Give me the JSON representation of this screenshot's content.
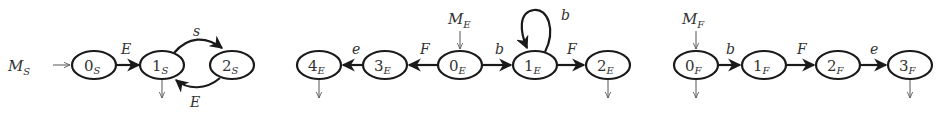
{
  "diagram": {
    "machines": [
      {
        "id": "S",
        "start_label": "M",
        "start_sub": "S",
        "nodes": [
          {
            "id": "0S",
            "num": "0",
            "sub": "S",
            "x": 94,
            "final": false
          },
          {
            "id": "1S",
            "num": "1",
            "sub": "S",
            "x": 162,
            "final": true
          },
          {
            "id": "2S",
            "num": "2",
            "sub": "S",
            "x": 232,
            "final": false
          }
        ],
        "edges": [
          {
            "from": "0S",
            "to": "1S",
            "label": "E"
          },
          {
            "from": "1S",
            "to": "2S",
            "label": "s"
          },
          {
            "from": "2S",
            "to": "1S",
            "label": "E"
          }
        ]
      },
      {
        "id": "E",
        "start_label": "M",
        "start_sub": "E",
        "nodes": [
          {
            "id": "4E",
            "num": "4",
            "sub": "E",
            "x": 319,
            "final": true
          },
          {
            "id": "3E",
            "num": "3",
            "sub": "E",
            "x": 385,
            "final": false
          },
          {
            "id": "0E",
            "num": "0",
            "sub": "E",
            "x": 460,
            "final": false
          },
          {
            "id": "1E",
            "num": "1",
            "sub": "E",
            "x": 535,
            "final": false
          },
          {
            "id": "2E",
            "num": "2",
            "sub": "E",
            "x": 608,
            "final": true
          }
        ],
        "edges": [
          {
            "from": "0E",
            "to": "3E",
            "label": "F"
          },
          {
            "from": "3E",
            "to": "4E",
            "label": "e"
          },
          {
            "from": "0E",
            "to": "1E",
            "label": "b"
          },
          {
            "from": "1E",
            "to": "1E",
            "label": "b"
          },
          {
            "from": "1E",
            "to": "2E",
            "label": "F"
          }
        ]
      },
      {
        "id": "F",
        "start_label": "M",
        "start_sub": "F",
        "nodes": [
          {
            "id": "0F",
            "num": "0",
            "sub": "F",
            "x": 696,
            "final": true
          },
          {
            "id": "1F",
            "num": "1",
            "sub": "F",
            "x": 764,
            "final": false
          },
          {
            "id": "2F",
            "num": "2",
            "sub": "F",
            "x": 838,
            "final": false
          },
          {
            "id": "3F",
            "num": "3",
            "sub": "F",
            "x": 910,
            "final": true
          }
        ],
        "edges": [
          {
            "from": "0F",
            "to": "1F",
            "label": "b"
          },
          {
            "from": "1F",
            "to": "2F",
            "label": "F"
          },
          {
            "from": "2F",
            "to": "3F",
            "label": "e"
          }
        ]
      }
    ]
  },
  "labels": {
    "MS": "M",
    "MS_sub": "S",
    "ME": "M",
    "ME_sub": "E",
    "MF": "M",
    "MF_sub": "F",
    "n0S": "0",
    "n0S_sub": "S",
    "n1S": "1",
    "n1S_sub": "S",
    "n2S": "2",
    "n2S_sub": "S",
    "n4E": "4",
    "n4E_sub": "E",
    "n3E": "3",
    "n3E_sub": "E",
    "n0E": "0",
    "n0E_sub": "E",
    "n1E": "1",
    "n1E_sub": "E",
    "n2E": "2",
    "n2E_sub": "E",
    "n0F": "0",
    "n0F_sub": "F",
    "n1F": "1",
    "n1F_sub": "F",
    "n2F": "2",
    "n2F_sub": "F",
    "n3F": "3",
    "n3F_sub": "F",
    "e_0S_1S": "E",
    "e_1S_2S": "s",
    "e_2S_1S": "E",
    "e_0E_3E": "F",
    "e_3E_4E": "e",
    "e_0E_1E": "b",
    "e_1E_1E": "b",
    "e_1E_2E": "F",
    "e_0F_1F": "b",
    "e_1F_2F": "F",
    "e_2F_3F": "e"
  }
}
